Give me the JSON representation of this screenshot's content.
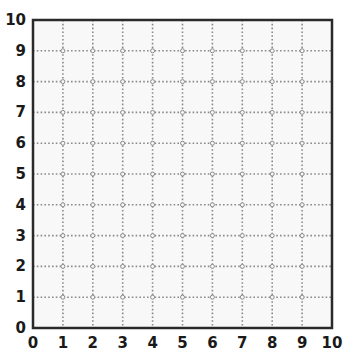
{
  "grid": {
    "x_min": 0,
    "x_max": 10,
    "y_min": 0,
    "y_max": 10,
    "x_ticks": [
      "0",
      "1",
      "2",
      "3",
      "4",
      "5",
      "6",
      "7",
      "8",
      "9",
      "10"
    ],
    "y_ticks": [
      "0",
      "1",
      "2",
      "3",
      "4",
      "5",
      "6",
      "7",
      "8",
      "9",
      "10"
    ],
    "gridline_style": "dotted",
    "intersection_markers": "small-circles"
  },
  "colors": {
    "frame": "#2a2a2a",
    "gridline": "#8a8a8a",
    "background": "#f8f8f8",
    "label": "#1a1a1a"
  },
  "chart_data": {
    "type": "table",
    "title": "",
    "xlabel": "",
    "ylabel": "",
    "xlim": [
      0,
      10
    ],
    "ylim": [
      0,
      10
    ],
    "x_tick_labels": [
      "0",
      "1",
      "2",
      "3",
      "4",
      "5",
      "6",
      "7",
      "8",
      "9",
      "10"
    ],
    "y_tick_labels": [
      "0",
      "1",
      "2",
      "3",
      "4",
      "5",
      "6",
      "7",
      "8",
      "9",
      "10"
    ],
    "grid": true,
    "series": []
  }
}
